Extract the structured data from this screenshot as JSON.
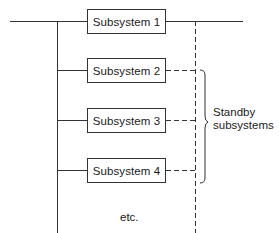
{
  "diagram": {
    "type": "standby redundancy block diagram",
    "subsystems": [
      {
        "label": "Subsystem 1",
        "role": "active"
      },
      {
        "label": "Subsystem 2",
        "role": "standby"
      },
      {
        "label": "Subsystem 3",
        "role": "standby"
      },
      {
        "label": "Subsystem 4",
        "role": "standby"
      }
    ],
    "brace_label_line1": "Standby",
    "brace_label_line2": "subsystems",
    "continuation_label": "etc.",
    "colors": {
      "line": "#333333",
      "background": "#ffffff"
    }
  }
}
